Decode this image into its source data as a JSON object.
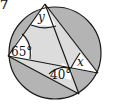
{
  "problem_number": "7",
  "diagram": {
    "type": "circle-inscribed-lines",
    "colors": {
      "outer_segments": "#b4b4b4",
      "inner_region": "#dcdcdc",
      "angle_regions": "#ffffff",
      "stroke": "#1a1a1a"
    },
    "labels": {
      "top_angle": "y",
      "left_angle": "65°",
      "middle_angle": "40°",
      "right_angle": "x"
    }
  }
}
